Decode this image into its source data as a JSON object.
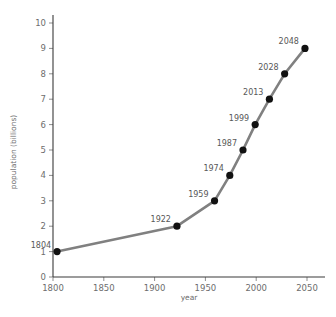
{
  "chart_data": {
    "type": "line",
    "title": "",
    "xlabel": "year",
    "ylabel": "population (billions)",
    "xlim": [
      1790,
      2060
    ],
    "ylim": [
      0,
      10.3
    ],
    "grid": false,
    "legend": "none",
    "line_color": "#808080",
    "marker_color": "#111111",
    "text_color": "#6d6d6d",
    "x": [
      1804,
      1922,
      1959,
      1974,
      1987,
      1999,
      2013,
      2028,
      2048
    ],
    "values": [
      1,
      2,
      3,
      4,
      5,
      6,
      7,
      8,
      9
    ],
    "point_labels": [
      "1804",
      "1922",
      "1959",
      "1974",
      "1987",
      "1999",
      "2013",
      "2028",
      "2048"
    ],
    "xticks": [
      1800,
      1850,
      1900,
      1950,
      2000,
      2050
    ],
    "xtick_labels": [
      "1800",
      "1850",
      "1900",
      "1950",
      "2000",
      "2050"
    ],
    "yticks": [
      0,
      1,
      2,
      3,
      4,
      5,
      6,
      7,
      8,
      9,
      10
    ],
    "ytick_labels": [
      "0",
      "1",
      "2",
      "3",
      "4",
      "5",
      "6",
      "7",
      "8",
      "9",
      "10"
    ]
  }
}
